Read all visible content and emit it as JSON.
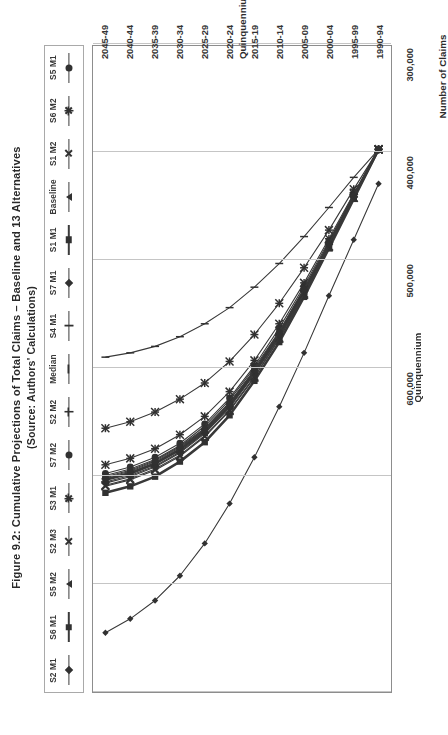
{
  "figure": {
    "title_line1": "Figure 9.2:  Cumulative Projections of Total Claims – Baseline and 13 Alternatives",
    "title_line2": "(Source:  Authors' Calculations)"
  },
  "axes": {
    "x_title": "Quinquennium",
    "y_title": "Number of Claims",
    "x_ticks": [
      "1990-94",
      "1995-99",
      "2000-04",
      "2005-09",
      "2010-14",
      "2015-19",
      "2020-24",
      "2025-29",
      "2030-34",
      "2035-39",
      "2040-44",
      "2045-49"
    ],
    "y_ticks": [
      "0",
      "100,000",
      "200,000",
      "300,000",
      "400,000",
      "500,000",
      "600,000"
    ]
  },
  "legend": {
    "entries": [
      {
        "label": "S2 M1",
        "marker": "diamond",
        "weight": "thin"
      },
      {
        "label": "S6 M1",
        "marker": "square",
        "weight": "thick"
      },
      {
        "label": "S5 M2",
        "marker": "triangle",
        "weight": "thin"
      },
      {
        "label": "S2 M3",
        "marker": "x",
        "weight": "thin"
      },
      {
        "label": "S3 M1",
        "marker": "star",
        "weight": "thin"
      },
      {
        "label": "S7 M2",
        "marker": "circle",
        "weight": "thin"
      },
      {
        "label": "S2 M2",
        "marker": "plus",
        "weight": "thin"
      },
      {
        "label": "Median",
        "marker": "dash",
        "weight": "thin"
      },
      {
        "label": "S4 M1",
        "marker": "bar",
        "weight": "thin"
      },
      {
        "label": "S7 M1",
        "marker": "diamond",
        "weight": "thin"
      },
      {
        "label": "S1 M1",
        "marker": "square",
        "weight": "thick"
      },
      {
        "label": "Baseline",
        "marker": "triangle",
        "weight": "thin"
      },
      {
        "label": "S1 M2",
        "marker": "x",
        "weight": "thin"
      },
      {
        "label": "S6 M2",
        "marker": "star",
        "weight": "thin"
      },
      {
        "label": "S5 M1",
        "marker": "circle",
        "weight": "thin"
      }
    ]
  },
  "chart_data": {
    "type": "line",
    "title": "Figure 9.2:  Cumulative Projections of Total Claims – Baseline and 13 Alternatives (Source:  Authors' Calculations)",
    "xlabel": "Quinquennium",
    "ylabel": "Number of Claims",
    "grid": true,
    "legend_position": "top",
    "ylim": [
      0,
      600000
    ],
    "ytick_step": 100000,
    "categories": [
      "1990-94",
      "1995-99",
      "2000-04",
      "2005-09",
      "2010-14",
      "2015-19",
      "2020-24",
      "2025-29",
      "2030-34",
      "2035-39",
      "2040-44",
      "2045-49"
    ],
    "series": [
      {
        "name": "S2 M1",
        "marker": "diamond",
        "weight": "thin",
        "values": [
          128000,
          180000,
          232000,
          285000,
          335000,
          382000,
          425000,
          462000,
          492000,
          515000,
          532000,
          545000
        ]
      },
      {
        "name": "S6 M1",
        "marker": "square",
        "weight": "thick",
        "values": [
          96000,
          140000,
          185000,
          228000,
          268000,
          303000,
          334000,
          358000,
          375000,
          388000,
          397000,
          403000
        ]
      },
      {
        "name": "S5 M2",
        "marker": "triangle",
        "weight": "thin",
        "values": [
          96000,
          139000,
          183000,
          226000,
          266000,
          301000,
          331000,
          355000,
          372000,
          385000,
          394000,
          400000
        ]
      },
      {
        "name": "S2 M3",
        "marker": "x",
        "weight": "thin",
        "values": [
          96000,
          141000,
          187000,
          231000,
          272000,
          308000,
          339000,
          363000,
          381000,
          394000,
          403000,
          409000
        ]
      },
      {
        "name": "S3 M1",
        "marker": "star",
        "weight": "thin",
        "values": [
          96000,
          133000,
          171000,
          206000,
          239000,
          268000,
          293000,
          313000,
          328000,
          340000,
          349000,
          355000
        ]
      },
      {
        "name": "S7 M2",
        "marker": "circle",
        "weight": "thin",
        "values": [
          96000,
          138000,
          181000,
          223000,
          262000,
          297000,
          327000,
          351000,
          369000,
          382000,
          391000,
          397000
        ]
      },
      {
        "name": "S2 M2",
        "marker": "plus",
        "weight": "thin",
        "values": [
          96000,
          140000,
          184000,
          227000,
          267000,
          302000,
          332000,
          356000,
          374000,
          387000,
          396000,
          402000
        ]
      },
      {
        "name": "Median",
        "marker": "dash",
        "weight": "thin",
        "values": [
          96000,
          139000,
          183000,
          225000,
          265000,
          299000,
          329000,
          353000,
          371000,
          384000,
          393000,
          399000
        ]
      },
      {
        "name": "S4 M1",
        "marker": "bar",
        "weight": "thin",
        "values": [
          96000,
          122000,
          150000,
          177000,
          202000,
          224000,
          243000,
          258000,
          270000,
          279000,
          285000,
          289000
        ]
      },
      {
        "name": "S7 M1",
        "marker": "diamond",
        "weight": "thin",
        "values": [
          96000,
          140000,
          185000,
          228000,
          269000,
          304000,
          335000,
          359000,
          377000,
          390000,
          399000,
          405000
        ]
      },
      {
        "name": "S1 M1",
        "marker": "square",
        "weight": "thick",
        "values": [
          96000,
          142000,
          188000,
          233000,
          275000,
          311000,
          343000,
          368000,
          386000,
          400000,
          409000,
          415000
        ]
      },
      {
        "name": "Baseline",
        "marker": "triangle",
        "weight": "thin",
        "values": [
          96000,
          140000,
          186000,
          229000,
          270000,
          305000,
          336000,
          360000,
          378000,
          391000,
          400000,
          406000
        ]
      },
      {
        "name": "S1 M2",
        "marker": "x",
        "weight": "thin",
        "values": [
          96000,
          141000,
          186000,
          230000,
          271000,
          307000,
          338000,
          362000,
          380000,
          393000,
          402000,
          408000
        ]
      },
      {
        "name": "S6 M2",
        "marker": "star",
        "weight": "thin",
        "values": [
          96000,
          137000,
          179000,
          220000,
          258000,
          292000,
          321000,
          344000,
          361000,
          374000,
          383000,
          389000
        ]
      },
      {
        "name": "S5 M1",
        "marker": "circle",
        "weight": "thin",
        "values": [
          96000,
          139000,
          184000,
          226000,
          266000,
          301000,
          332000,
          356000,
          373000,
          386000,
          395000,
          401000
        ]
      }
    ]
  }
}
